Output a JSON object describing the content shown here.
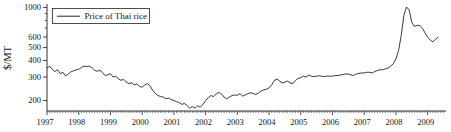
{
  "figure": {
    "background": "#ffffff",
    "colors": {
      "axis": "#1a1a1a",
      "line": "#222222",
      "text": "#141414",
      "legend_border": "#222222"
    }
  },
  "chart_data": {
    "type": "line",
    "title": "",
    "xlabel": "",
    "ylabel": "$/MT",
    "y_scale": "log",
    "ylim": [
      167,
      1060
    ],
    "grid": false,
    "x_tick_years": [
      1997,
      1998,
      1999,
      2000,
      2001,
      2002,
      2003,
      2004,
      2005,
      2006,
      2007,
      2008,
      2009
    ],
    "x_minor_ticks": "monthly",
    "y_ticks_labeled": [
      200,
      300,
      400,
      500,
      600,
      1000
    ],
    "y_ticks_minor": [
      700,
      800,
      900
    ],
    "legend": {
      "position": "upper-left",
      "entries": [
        "Price of Thai rice"
      ]
    },
    "series": [
      {
        "name": "Price of Thai rice",
        "x_start_year": 1997,
        "x_start_month": 1,
        "points_per_year": 12,
        "x_end": "2009-05",
        "values": [
          352,
          362,
          344,
          330,
          341,
          318,
          326,
          306,
          316,
          328,
          334,
          340,
          343,
          354,
          363,
          360,
          362,
          353,
          338,
          332,
          337,
          325,
          308,
          313,
          318,
          300,
          305,
          290,
          284,
          288,
          275,
          268,
          272,
          262,
          267,
          255,
          252,
          262,
          268,
          258,
          238,
          226,
          218,
          214,
          212,
          206,
          209,
          203,
          200,
          196,
          193,
          187,
          190,
          183,
          175,
          180,
          175,
          183,
          178,
          187,
          200,
          210,
          218,
          214,
          224,
          230,
          224,
          212,
          206,
          212,
          218,
          220,
          219,
          225,
          216,
          220,
          225,
          229,
          226,
          222,
          228,
          236,
          240,
          243,
          249,
          262,
          283,
          290,
          280,
          271,
          275,
          280,
          271,
          268,
          283,
          293,
          297,
          305,
          300,
          310,
          305,
          302,
          305,
          307,
          304,
          303,
          305,
          305,
          305,
          308,
          308,
          311,
          313,
          317,
          316,
          312,
          308,
          317,
          320,
          322,
          322,
          326,
          326,
          322,
          330,
          336,
          341,
          340,
          346,
          350,
          362,
          378,
          410,
          475,
          615,
          870,
          1010,
          960,
          775,
          720,
          735,
          732,
          700,
          645,
          600,
          568,
          552,
          578,
          598
        ]
      }
    ]
  }
}
